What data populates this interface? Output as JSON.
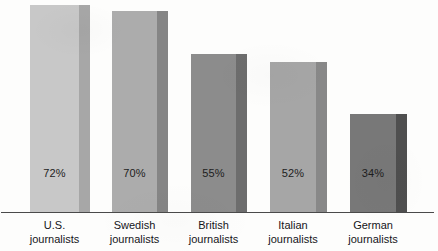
{
  "chart_data": {
    "type": "bar",
    "title": "",
    "subtitle": "",
    "xlabel": "",
    "ylabel": "",
    "ylim": [
      0,
      100
    ],
    "grid": false,
    "legend": false,
    "legend_position": "none",
    "orientation": "vertical",
    "categories": [
      "U.S. journalists",
      "Swedish journalists",
      "British journalists",
      "Italian journalists",
      "German journalists"
    ],
    "values": [
      72,
      70,
      55,
      52,
      34
    ],
    "data_labels": [
      "72%",
      "70%",
      "55%",
      "52%",
      "34%"
    ],
    "annotations": []
  },
  "bars": [
    {
      "label_line1": "U.S.",
      "label_line2": "journalists",
      "value": 72,
      "value_label": "72%",
      "face_color": "#c8c8c8",
      "side_color": "#a7a7a7",
      "x": 30,
      "width": 60
    },
    {
      "label_line1": "Swedish",
      "label_line2": "journalists",
      "value": 70,
      "value_label": "70%",
      "face_color": "#acacac",
      "side_color": "#858585",
      "x": 112,
      "width": 56
    },
    {
      "label_line1": "British",
      "label_line2": "journalists",
      "value": 55,
      "value_label": "55%",
      "face_color": "#8c8c8c",
      "side_color": "#6d6d6d",
      "x": 191,
      "width": 56
    },
    {
      "label_line1": "Italian",
      "label_line2": "journalists",
      "value": 52,
      "value_label": "52%",
      "face_color": "#a6a6a6",
      "side_color": "#888888",
      "x": 270,
      "width": 57
    },
    {
      "label_line1": "German",
      "label_line2": "journalists",
      "value": 34,
      "value_label": "34%",
      "face_color": "#787878",
      "side_color": "#4f4f4f",
      "x": 350,
      "width": 57
    }
  ],
  "axis": {
    "baseline_color": "#4a4a4a"
  },
  "geometry": {
    "baseline_y": 212,
    "value_label_y": 168,
    "pixels_per_percent": 2.875
  }
}
